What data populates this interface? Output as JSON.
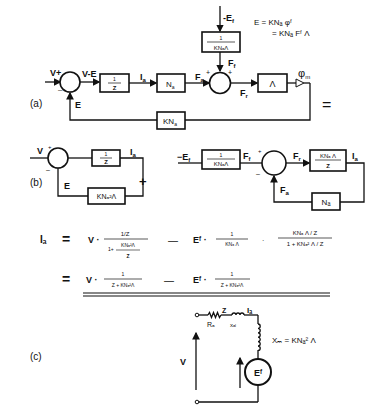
{
  "figure": {
    "parts": [
      "(a)",
      "(b)",
      "(c)"
    ]
  },
  "part_a": {
    "label": "(a)",
    "input_label": "V+",
    "sum1_minus": "–",
    "sum1_out": "V-E",
    "block_inv_z": {
      "num": "1",
      "den": "Z"
    },
    "current": "I",
    "current_sub": "a",
    "block_na": "N",
    "block_na_sub": "a",
    "fa": "F",
    "fa_sub": "a",
    "sum2_plus_left": "+",
    "sum2_plus_top": "+",
    "ef_label": "-E",
    "ef_sub": "f",
    "block_inv_k": {
      "num": "1",
      "den": "KNₐΛ"
    },
    "ff": "F",
    "ff_sub": "f",
    "fr": "F",
    "fr_sub": "r",
    "block_lambda": "Λ",
    "phi": "φ",
    "phi_sub": "m",
    "feedback_e": "E",
    "block_kna": "KN",
    "block_kna_sub": "a",
    "eq_line1": "E  = KNₐ φᶠ",
    "eq_line2": "= KNₐ Fᶠ Λ",
    "equals": "="
  },
  "part_b": {
    "label": "(b)",
    "left": {
      "input": "V",
      "plus": "+",
      "minus": "–",
      "block_inv_z": {
        "num": "1",
        "den": "Z"
      },
      "output": "I",
      "output_sub": "a",
      "feedback": "E",
      "block_fb": "KNₐ²Λ"
    },
    "plus_sign": "+",
    "right": {
      "input": "−E",
      "input_sub": "f",
      "block_inv_k": {
        "num": "1",
        "den": "KNₐΛ"
      },
      "ff": "F",
      "ff_sub": "f",
      "plus": "+",
      "minus": "–",
      "fr": "F",
      "fr_sub": "r",
      "block_fwd": {
        "num": "KNₐ Λ",
        "den": "Z"
      },
      "output": "I",
      "output_sub": "a",
      "fa": "F",
      "fa_sub": "a",
      "block_fb": "Nₐ"
    }
  },
  "equations": {
    "lhs": "Iₐ",
    "eq": "=",
    "line1": {
      "v": "V ·",
      "frac1_num": "1/Z",
      "frac1_den_a": "1+",
      "frac1_den_num": "KNₐ²Λ",
      "frac1_den_den": "Z",
      "minus": "—",
      "ef": "Eᶠ ·",
      "frac2_num": "1",
      "frac2_den": "KNₐ Λ",
      "dot": "·",
      "frac3_num": "KNₐ Λ / Z",
      "frac3_den": "1 + KNₐ² Λ / Z"
    },
    "line2": {
      "v": "V ·",
      "frac1_num": "1",
      "frac1_den": "Z + KNₐ²Λ",
      "minus": "—",
      "ef": "Eᶠ ·",
      "frac2_num": "1",
      "frac2_den": "Z + KNₐ²Λ"
    }
  },
  "part_c": {
    "label": "(c)",
    "z": "Z",
    "ia": "Iₐ",
    "ra": "Rₐ",
    "xal": "xₐₗ",
    "xm": "Xₘ = KNₐ² Λ",
    "v": "V",
    "source": "Eᶠ"
  }
}
